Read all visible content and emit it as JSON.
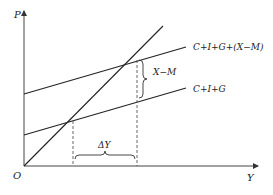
{
  "diagram": {
    "axes": {
      "y_label": "P",
      "x_label": "Y",
      "origin_label": "O"
    },
    "lines": [
      {
        "name": "forty-five-degree-line",
        "label": ""
      },
      {
        "name": "aggregate-demand-open",
        "label": "C+I+G+(X−M)"
      },
      {
        "name": "aggregate-demand-closed",
        "label": "C+I+G"
      }
    ],
    "annotations": {
      "net_exports_brace": "X−M",
      "income_change_brace": "ΔY"
    },
    "colors": {
      "line": "#222222",
      "axis": "#444444",
      "background": "#ffffff"
    }
  }
}
